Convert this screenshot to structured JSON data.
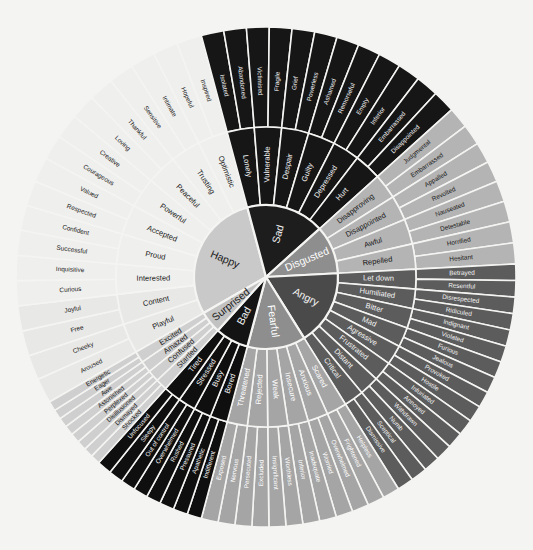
{
  "diagram": {
    "background_color": "#f4f4f2",
    "divider_color": "#f4f4f2",
    "center": {
      "x": 266,
      "y": 277
    },
    "radii": {
      "core": 72,
      "mid": 150,
      "outer": 250
    },
    "ring_count": 3
  },
  "core_emotions": [
    {
      "label": "Happy",
      "color": "#c9c9c9",
      "text_color": "#1a1a1a",
      "start_angle": 150,
      "end_angle": 255,
      "secondary": [
        {
          "label": "Playful",
          "color": "#e8e8e6",
          "text_color": "#1a1a1a",
          "tertiary": [
            "Aroused",
            "Cheeky"
          ]
        },
        {
          "label": "Content",
          "color": "#e8e8e6",
          "text_color": "#1a1a1a",
          "tertiary": [
            "Free",
            "Joyful"
          ]
        },
        {
          "label": "Interested",
          "color": "#efefed",
          "text_color": "#1a1a1a",
          "tertiary": [
            "Curious",
            "Inquisitive"
          ]
        },
        {
          "label": "Proud",
          "color": "#efefed",
          "text_color": "#1a1a1a",
          "tertiary": [
            "Successful",
            "Confident"
          ]
        },
        {
          "label": "Accepted",
          "color": "#efefed",
          "text_color": "#1a1a1a",
          "tertiary": [
            "Respected",
            "Valued"
          ]
        },
        {
          "label": "Powerful",
          "color": "#efefed",
          "text_color": "#1a1a1a",
          "tertiary": [
            "Courageous",
            "Creative"
          ]
        },
        {
          "label": "Peaceful",
          "color": "#efefed",
          "text_color": "#1a1a1a",
          "tertiary": [
            "Loving",
            "Thankful"
          ]
        },
        {
          "label": "Trusting",
          "color": "#efefed",
          "text_color": "#1a1a1a",
          "tertiary": [
            "Sensitive",
            "Intimate"
          ]
        },
        {
          "label": "Optimistic",
          "color": "#efefed",
          "text_color": "#1a1a1a",
          "tertiary": [
            "Hopeful",
            "Inspired"
          ]
        }
      ]
    },
    {
      "label": "Sad",
      "color": "#1d1d1d",
      "text_color": "#f2f2f2",
      "start_angle": 255,
      "end_angle": 318,
      "secondary": [
        {
          "label": "Lonely",
          "color": "#161616",
          "text_color": "#f2f2f2",
          "tertiary": [
            "Isolated",
            "Abandoned"
          ]
        },
        {
          "label": "Vulnerable",
          "color": "#161616",
          "text_color": "#f2f2f2",
          "tertiary": [
            "Victimised",
            "Fragile"
          ]
        },
        {
          "label": "Despair",
          "color": "#161616",
          "text_color": "#f2f2f2",
          "tertiary": [
            "Grief",
            "Powerless"
          ]
        },
        {
          "label": "Guilty",
          "color": "#161616",
          "text_color": "#f2f2f2",
          "tertiary": [
            "Ashamed",
            "Remorseful"
          ]
        },
        {
          "label": "Depressed",
          "color": "#161616",
          "text_color": "#f2f2f2",
          "tertiary": [
            "Empty",
            "Inferior"
          ]
        },
        {
          "label": "Hurt",
          "color": "#161616",
          "text_color": "#f2f2f2",
          "tertiary": [
            "Embarrassed",
            "Disappointed"
          ]
        }
      ]
    },
    {
      "label": "Disgusted",
      "color": "#8e8e8e",
      "text_color": "#ffffff",
      "start_angle": 318,
      "end_angle": 357,
      "secondary": [
        {
          "label": "Disapproving",
          "color": "#b4b4b4",
          "text_color": "#1a1a1a",
          "tertiary": [
            "Judgmental",
            "Embarrassed"
          ]
        },
        {
          "label": "Disappointed",
          "color": "#b4b4b4",
          "text_color": "#1a1a1a",
          "tertiary": [
            "Appalled",
            "Revolted"
          ]
        },
        {
          "label": "Awful",
          "color": "#b4b4b4",
          "text_color": "#1a1a1a",
          "tertiary": [
            "Nauseated",
            "Detestable"
          ]
        },
        {
          "label": "Repelled",
          "color": "#b4b4b4",
          "text_color": "#1a1a1a",
          "tertiary": [
            "Horrified",
            "Hesitant"
          ]
        }
      ]
    },
    {
      "label": "Angry",
      "color": "#4a4a4a",
      "text_color": "#f2f2f2",
      "start_angle": 357,
      "end_angle": 58,
      "secondary": [
        {
          "label": "Let down",
          "color": "#5c5c5c",
          "text_color": "#f2f2f2",
          "tertiary": [
            "Betrayed",
            "Resentful"
          ]
        },
        {
          "label": "Humiliated",
          "color": "#5c5c5c",
          "text_color": "#f2f2f2",
          "tertiary": [
            "Disrespected",
            "Ridiculed"
          ]
        },
        {
          "label": "Bitter",
          "color": "#5c5c5c",
          "text_color": "#f2f2f2",
          "tertiary": [
            "Indignant",
            "Violated"
          ]
        },
        {
          "label": "Mad",
          "color": "#5c5c5c",
          "text_color": "#f2f2f2",
          "tertiary": [
            "Furious",
            "Jealous"
          ]
        },
        {
          "label": "Agressive",
          "color": "#5c5c5c",
          "text_color": "#f2f2f2",
          "tertiary": [
            "Provoked",
            "Hostile"
          ]
        },
        {
          "label": "Frustrated",
          "color": "#5c5c5c",
          "text_color": "#f2f2f2",
          "tertiary": [
            "Infuriated",
            "Annoyed"
          ]
        },
        {
          "label": "Distant",
          "color": "#5c5c5c",
          "text_color": "#f2f2f2",
          "tertiary": [
            "Withdrawn",
            "Numb"
          ]
        },
        {
          "label": "Critical",
          "color": "#5c5c5c",
          "text_color": "#f2f2f2",
          "tertiary": [
            "Sceptical",
            "Dismissive"
          ]
        }
      ]
    },
    {
      "label": "Fearful",
      "color": "#8e8e8e",
      "text_color": "#ffffff",
      "start_angle": 58,
      "end_angle": 105,
      "secondary": [
        {
          "label": "Scared",
          "color": "#a5a5a5",
          "text_color": "#ffffff",
          "tertiary": [
            "Helpless",
            "Frightened"
          ]
        },
        {
          "label": "Anxious",
          "color": "#a5a5a5",
          "text_color": "#ffffff",
          "tertiary": [
            "Overwhelmed",
            "Worried"
          ]
        },
        {
          "label": "Insecure",
          "color": "#a5a5a5",
          "text_color": "#ffffff",
          "tertiary": [
            "Inadequate",
            "Inferior"
          ]
        },
        {
          "label": "Weak",
          "color": "#a5a5a5",
          "text_color": "#ffffff",
          "tertiary": [
            "Worthless",
            "Insignificant"
          ]
        },
        {
          "label": "Rejected",
          "color": "#a5a5a5",
          "text_color": "#ffffff",
          "tertiary": [
            "Excluded",
            "Persecuted"
          ]
        },
        {
          "label": "Threatened",
          "color": "#a5a5a5",
          "text_color": "#ffffff",
          "tertiary": [
            "Nervous",
            "Exposed"
          ]
        }
      ]
    },
    {
      "label": "Bad",
      "color": "#141414",
      "text_color": "#f2f2f2",
      "start_angle": 105,
      "end_angle": 132,
      "secondary": [
        {
          "label": "Bored",
          "color": "#0f0f0f",
          "text_color": "#f2f2f2",
          "tertiary": [
            "Indifferent",
            "Apathetic"
          ]
        },
        {
          "label": "Busy",
          "color": "#0f0f0f",
          "text_color": "#f2f2f2",
          "tertiary": [
            "Pressured",
            "Rushed"
          ]
        },
        {
          "label": "Stressed",
          "color": "#0f0f0f",
          "text_color": "#f2f2f2",
          "tertiary": [
            "Overwhelmed",
            "Out of control"
          ]
        },
        {
          "label": "Tired",
          "color": "#0f0f0f",
          "text_color": "#f2f2f2",
          "tertiary": [
            "Sleepy",
            "Unfocused"
          ]
        }
      ]
    },
    {
      "label": "Surprised",
      "color": "#c2c2c2",
      "text_color": "#1a1a1a",
      "start_angle": 132,
      "end_angle": 150,
      "secondary": [
        {
          "label": "Startled",
          "color": "#cfcfcf",
          "text_color": "#1a1a1a",
          "tertiary": [
            "Shocked",
            "Dismayed"
          ]
        },
        {
          "label": "Confused",
          "color": "#cfcfcf",
          "text_color": "#1a1a1a",
          "tertiary": [
            "Disillusioned",
            "Perplexed"
          ]
        },
        {
          "label": "Amazed",
          "color": "#cfcfcf",
          "text_color": "#1a1a1a",
          "tertiary": [
            "Astonished",
            "Awe"
          ]
        },
        {
          "label": "Excited",
          "color": "#cfcfcf",
          "text_color": "#1a1a1a",
          "tertiary": [
            "Eager",
            "Energetic"
          ]
        }
      ]
    }
  ]
}
